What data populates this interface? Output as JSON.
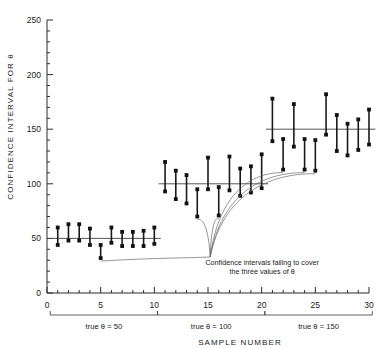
{
  "chart_data": {
    "type": "scatter",
    "title": "",
    "subtitle": "",
    "xlabel": "SAMPLE   NUMBER",
    "ylabel": "CONFIDENCE  INTERVAL  FOR  θ",
    "xlim": [
      0,
      30
    ],
    "ylim": [
      0,
      250
    ],
    "ytick_labels": [
      "0",
      "50",
      "100",
      "150",
      "200",
      "250"
    ],
    "ytick_values": [
      0,
      50,
      100,
      150,
      200,
      250
    ],
    "yminor_step": 10,
    "xtick_labels": [
      "0",
      "5",
      "10",
      "15",
      "20",
      "25",
      "30"
    ],
    "xtick_values": [
      0,
      5,
      10,
      15,
      20,
      25,
      30
    ],
    "xminor_step": 1,
    "grid": false,
    "legend": "none",
    "reference_lines": [
      {
        "label": "true θ = 50",
        "value": 50,
        "x_start": 1,
        "x_end": 10
      },
      {
        "label": "true θ = 100",
        "value": 100,
        "x_start": 11,
        "x_end": 20
      },
      {
        "label": "true θ = 150",
        "value": 150,
        "x_start": 21,
        "x_end": 30
      }
    ],
    "groups": [
      {
        "name": "true θ = 50",
        "true_value": 50,
        "x_start": 1,
        "x_end": 10,
        "intervals": [
          {
            "sample": 1,
            "lower": 44,
            "upper": 60,
            "covers": true
          },
          {
            "sample": 2,
            "lower": 48,
            "upper": 63,
            "covers": true
          },
          {
            "sample": 3,
            "lower": 48,
            "upper": 63,
            "covers": true
          },
          {
            "sample": 4,
            "lower": 44,
            "upper": 59,
            "covers": true
          },
          {
            "sample": 5,
            "lower": 32,
            "upper": 44,
            "covers": false
          },
          {
            "sample": 6,
            "lower": 46,
            "upper": 60,
            "covers": true
          },
          {
            "sample": 7,
            "lower": 43,
            "upper": 56,
            "covers": true
          },
          {
            "sample": 8,
            "lower": 43,
            "upper": 56,
            "covers": true
          },
          {
            "sample": 9,
            "lower": 43,
            "upper": 57,
            "covers": true
          },
          {
            "sample": 10,
            "lower": 45,
            "upper": 60,
            "covers": true
          }
        ]
      },
      {
        "name": "true θ = 100",
        "true_value": 100,
        "x_start": 11,
        "x_end": 20,
        "intervals": [
          {
            "sample": 11,
            "lower": 93,
            "upper": 120,
            "covers": true
          },
          {
            "sample": 12,
            "lower": 86,
            "upper": 112,
            "covers": true
          },
          {
            "sample": 13,
            "lower": 82,
            "upper": 108,
            "covers": true
          },
          {
            "sample": 14,
            "lower": 70,
            "upper": 95,
            "covers": false
          },
          {
            "sample": 15,
            "lower": 95,
            "upper": 124,
            "covers": true
          },
          {
            "sample": 16,
            "lower": 71,
            "upper": 97,
            "covers": false
          },
          {
            "sample": 17,
            "lower": 94,
            "upper": 125,
            "covers": true
          },
          {
            "sample": 18,
            "lower": 89,
            "upper": 114,
            "covers": true
          },
          {
            "sample": 19,
            "lower": 92,
            "upper": 116,
            "covers": true
          },
          {
            "sample": 20,
            "lower": 96,
            "upper": 127,
            "covers": true
          }
        ]
      },
      {
        "name": "true θ = 150",
        "true_value": 150,
        "x_start": 21,
        "x_end": 30,
        "intervals": [
          {
            "sample": 21,
            "lower": 139,
            "upper": 178,
            "covers": true
          },
          {
            "sample": 22,
            "lower": 113,
            "upper": 141,
            "covers": false
          },
          {
            "sample": 23,
            "lower": 134,
            "upper": 173,
            "covers": true
          },
          {
            "sample": 24,
            "lower": 113,
            "upper": 141,
            "covers": false
          },
          {
            "sample": 25,
            "lower": 112,
            "upper": 140,
            "covers": false
          },
          {
            "sample": 26,
            "lower": 145,
            "upper": 182,
            "covers": true
          },
          {
            "sample": 27,
            "lower": 130,
            "upper": 163,
            "covers": true
          },
          {
            "sample": 28,
            "lower": 126,
            "upper": 155,
            "covers": true
          },
          {
            "sample": 29,
            "lower": 131,
            "upper": 159,
            "covers": true
          },
          {
            "sample": 30,
            "lower": 136,
            "upper": 168,
            "covers": true
          }
        ]
      }
    ],
    "annotation": {
      "line1": "Confidence  intervals  failing  to  cover",
      "line2": "the  three  values  of  θ",
      "anchor_x": 15.2,
      "anchor_y": 33,
      "points_to": [
        5,
        14,
        16,
        22,
        24,
        25
      ]
    }
  }
}
